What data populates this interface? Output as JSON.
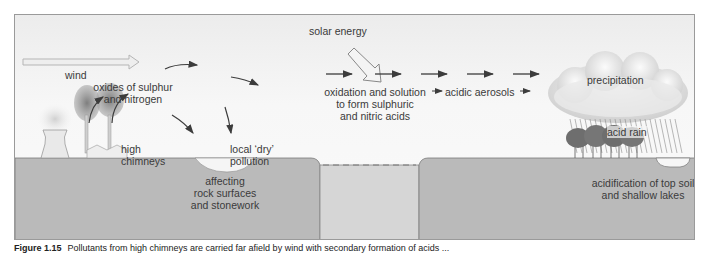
{
  "figure": {
    "labels": {
      "wind": "wind",
      "oxides_line1": "oxides of sulphur",
      "oxides_line2": "and nitrogen",
      "chimneys_line1": "high",
      "chimneys_line2": "chimneys",
      "local_line1": "local ‘dry’",
      "local_line2": "pollution",
      "affecting_line1": "affecting",
      "affecting_line2": "rock surfaces",
      "affecting_line3": "and stonework",
      "solar_energy": "solar energy",
      "oxidation_line1": "oxidation and solution",
      "oxidation_line2": "to form sulphuric",
      "oxidation_line3": "and nitric acids",
      "acidic_aerosols": "acidic aerosols",
      "precipitation": "precipitation",
      "acid_rain": "acid rain",
      "acidification_line1": "acidification of top soil",
      "acidification_line2": "and shallow lakes"
    },
    "colors": {
      "ground": "#b9b9b9",
      "ground_gap": "#d4d4d4",
      "sky": "#f2f2f2",
      "arrow": "#3c3c3c",
      "smoke": "#8f8f8f",
      "trees": "#6f6f6f"
    }
  },
  "caption": {
    "number": "Figure 1.15",
    "text": "Pollutants from high chimneys are carried far afield by wind with secondary formation of acids ..."
  }
}
